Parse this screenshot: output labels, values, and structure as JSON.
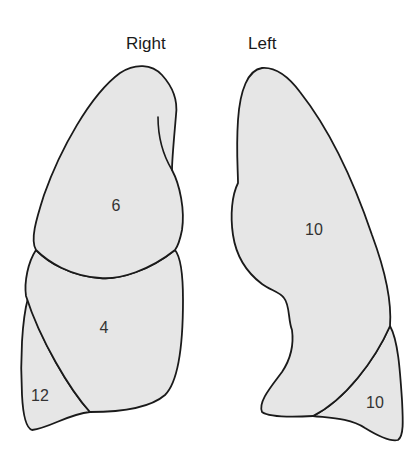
{
  "headings": {
    "right": "Right",
    "left": "Left"
  },
  "right_lung": {
    "lobes": [
      {
        "name": "upper",
        "label": "6"
      },
      {
        "name": "middle",
        "label": "4"
      },
      {
        "name": "lower",
        "label": "12"
      }
    ]
  },
  "left_lung": {
    "lobes": [
      {
        "name": "upper",
        "label": "10"
      },
      {
        "name": "lower",
        "label": "10"
      }
    ]
  },
  "colors": {
    "fill": "#e6e6e6",
    "stroke": "#1a1a1a"
  }
}
